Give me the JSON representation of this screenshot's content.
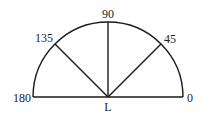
{
  "diagram": {
    "type": "semicircle-protractor",
    "center_label": "L",
    "angle_labels": {
      "a0": "0",
      "a45": "45",
      "a90": "90",
      "a135": "135",
      "a180": "180"
    },
    "colors": {
      "line": "#1a1a1a",
      "text": "#222222",
      "background": "#ffffff"
    }
  }
}
